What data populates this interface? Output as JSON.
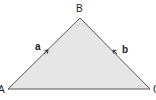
{
  "diagram": {
    "type": "triangle",
    "fill_color": "#e6e6e6",
    "stroke_color": "#555555",
    "vertices": [
      {
        "label": "A",
        "x": 8,
        "y": 89
      },
      {
        "label": "B",
        "x": 80,
        "y": 18
      },
      {
        "label": "C",
        "x": 150,
        "y": 89
      }
    ],
    "sides": [
      {
        "label": "a",
        "from": "A",
        "to": "B",
        "arrow": "toward B"
      },
      {
        "label": "b",
        "from": "C",
        "to": "B",
        "arrow": "toward B"
      }
    ]
  },
  "labels": {
    "vertex_a": "A",
    "vertex_b": "B",
    "vertex_c": "C",
    "side_a": "a",
    "side_b": "b"
  }
}
